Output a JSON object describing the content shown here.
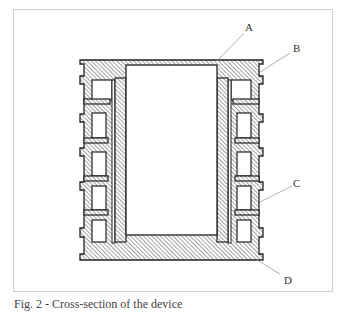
{
  "figure": {
    "labels": {
      "A": "A",
      "B": "B",
      "C": "C",
      "D": "D"
    },
    "caption": "Fig. 2 - Cross-section of the device",
    "colors": {
      "outline": "#222222",
      "hatch": "#555555",
      "leader": "#999999",
      "frame": "#cfcfcf"
    }
  }
}
